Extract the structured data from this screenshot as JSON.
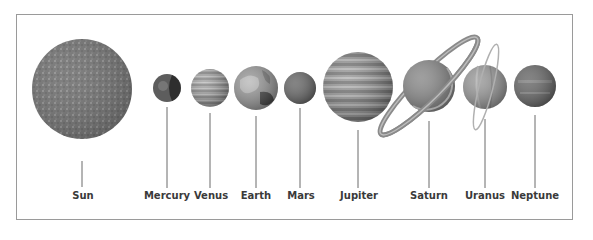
{
  "diagram": {
    "bodies": [
      {
        "name": "Sun",
        "cx": 82,
        "cy": 89,
        "r": 50,
        "line_top": 161,
        "fill": "#7a7a7a"
      },
      {
        "name": "Mercury",
        "cx": 167,
        "cy": 88,
        "r": 14,
        "line_top": 107,
        "fill": "#555555"
      },
      {
        "name": "Venus",
        "cx": 210,
        "cy": 88,
        "r": 19,
        "line_top": 113,
        "fill": "#a9a9a9"
      },
      {
        "name": "Earth",
        "cx": 256,
        "cy": 88,
        "r": 22,
        "line_top": 116,
        "fill": "#8c8c8c"
      },
      {
        "name": "Mars",
        "cx": 300,
        "cy": 88,
        "r": 16,
        "line_top": 108,
        "fill": "#707070"
      },
      {
        "name": "Jupiter",
        "cx": 358,
        "cy": 87,
        "r": 35,
        "line_top": 130,
        "fill": "#8f8f8f"
      },
      {
        "name": "Saturn",
        "cx": 429,
        "cy": 86,
        "r": 26,
        "line_top": 121,
        "fill": "#8a8a8a"
      },
      {
        "name": "Uranus",
        "cx": 485,
        "cy": 87,
        "r": 22,
        "line_top": 119,
        "fill": "#9b9b9b"
      },
      {
        "name": "Neptune",
        "cx": 535,
        "cy": 86,
        "r": 21,
        "line_top": 115,
        "fill": "#6e6e6e"
      }
    ],
    "labels": {
      "sun": "Sun",
      "mercury": "Mercury",
      "venus": "Venus",
      "earth": "Earth",
      "mars": "Mars",
      "jupiter": "Jupiter",
      "saturn": "Saturn",
      "uranus": "Uranus",
      "neptune": "Neptune"
    },
    "colors": {
      "border": "#9a9a9a",
      "line": "#6a6a6a",
      "text": "#3a3a3a"
    }
  }
}
